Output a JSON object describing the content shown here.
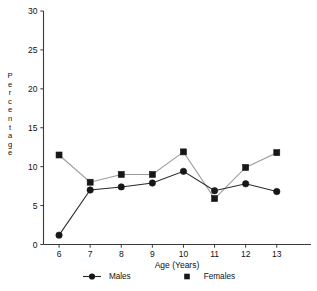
{
  "chart_data": {
    "type": "line",
    "title": "",
    "xlabel": "Age (Years)",
    "ylabel": "Percentage",
    "x": [
      6,
      7,
      8,
      9,
      10,
      11,
      12,
      13
    ],
    "xticklabels": [
      "6",
      "7",
      "8",
      "9",
      "10",
      "11",
      "12",
      "13"
    ],
    "yticks": [
      0,
      5,
      10,
      15,
      20,
      25,
      30
    ],
    "yticklabels": [
      "0",
      "5",
      "10",
      "15",
      "20",
      "25",
      "30"
    ],
    "xlim": [
      5.5,
      14.1
    ],
    "ylim": [
      0,
      30
    ],
    "grid": false,
    "legend_position": "bottom-center",
    "series": [
      {
        "name": "Males",
        "marker": "circle",
        "color": "#171717",
        "line_color": "#2b2b2b",
        "values": [
          1.2,
          7.0,
          7.4,
          7.9,
          9.4,
          6.9,
          7.8,
          6.8
        ]
      },
      {
        "name": "Females",
        "marker": "square",
        "color": "#171717",
        "line_color": "#9a9a9a",
        "values": [
          11.5,
          8.0,
          9.0,
          9.0,
          11.9,
          5.9,
          9.9,
          11.8
        ]
      }
    ]
  },
  "axes": {
    "y_axis_label_letters": [
      "P",
      "e",
      "r",
      "c",
      "e",
      "n",
      "t",
      "a",
      "g",
      "e"
    ],
    "x_axis_title": "Age (Years)"
  },
  "legend": {
    "items": [
      {
        "label": "Males",
        "marker": "circle-marker-icon"
      },
      {
        "label": "Females",
        "marker": "square-marker-icon"
      }
    ]
  }
}
